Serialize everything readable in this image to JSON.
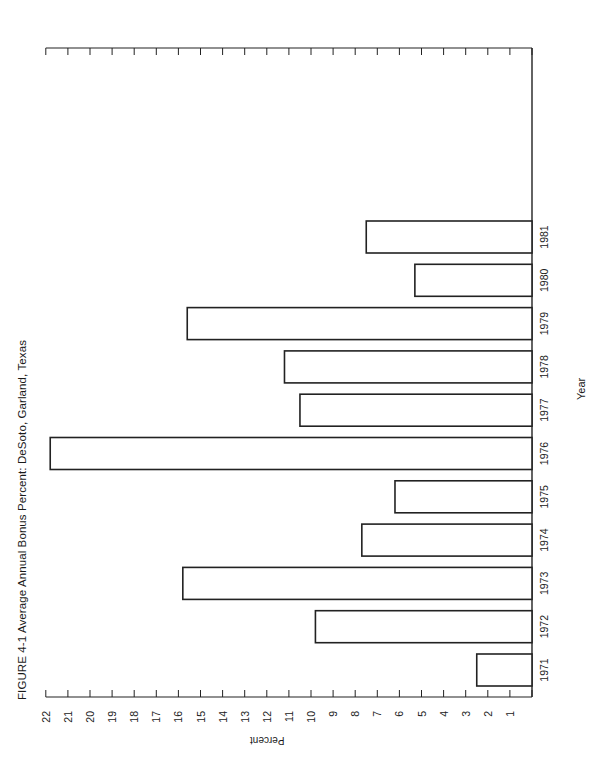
{
  "figure": {
    "title": "FIGURE 4-1  Average Annual Bonus Percent: DeSoto, Garland, Texas",
    "ylabel": "Percent",
    "xlabel": "Year"
  },
  "chart_data": {
    "type": "bar",
    "orientation": "rotated page (bars extend leftward from baseline; page rotated 90° counterclockwise)",
    "title": "FIGURE 4-1 Average Annual Bonus Percent: DeSoto, Garland, Texas",
    "xlabel": "Year",
    "ylabel": "Percent",
    "categories": [
      "1971",
      "1972",
      "1973",
      "1974",
      "1975",
      "1976",
      "1977",
      "1978",
      "1979",
      "1980",
      "1981"
    ],
    "values": [
      2.5,
      9.8,
      15.8,
      7.7,
      6.2,
      21.8,
      10.5,
      11.2,
      15.6,
      5.3,
      7.5
    ],
    "ylim": [
      0,
      22
    ],
    "yticks": [
      1,
      2,
      3,
      4,
      5,
      6,
      7,
      8,
      9,
      10,
      11,
      12,
      13,
      14,
      15,
      16,
      17,
      18,
      19,
      20,
      21,
      22
    ],
    "grid": false,
    "legend": null
  }
}
